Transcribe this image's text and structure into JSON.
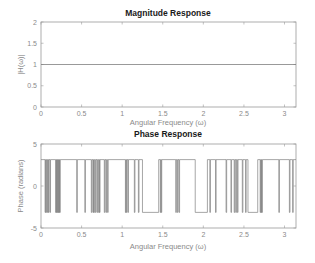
{
  "chart_data": [
    {
      "type": "line",
      "title": "Magnitude Response",
      "xlabel": "Angular Frequency (ω)",
      "ylabel": "|H(ω)|",
      "xlim": [
        0,
        3.1416
      ],
      "ylim": [
        0,
        2
      ],
      "xticks": [
        "0",
        "0.5",
        "1",
        "1.5",
        "2",
        "2.5",
        "3"
      ],
      "yticks": [
        "0",
        "0.5",
        "1",
        "1.5",
        "2"
      ],
      "grid": false,
      "series": [
        {
          "name": "|H(ω)|",
          "x": [
            0,
            3.1416
          ],
          "y": [
            1,
            1
          ],
          "color": "#7f7f7f"
        }
      ]
    },
    {
      "type": "line",
      "title": "Phase Response",
      "xlabel": "Angular Frequency (ω)",
      "ylabel": "Phase (radians)",
      "xlim": [
        0,
        3.1416
      ],
      "ylim": [
        -5,
        5
      ],
      "xticks": [
        "0",
        "0.5",
        "1",
        "1.5",
        "2",
        "2.5",
        "3"
      ],
      "yticks": [
        "-5",
        "0",
        "5"
      ],
      "grid": false,
      "levels": {
        "high": 3.1416,
        "low": -3.1416
      },
      "series": [
        {
          "name": "phase",
          "color": "#7f7f7f",
          "spikes": [
            0.05,
            0.06,
            0.08,
            0.09,
            0.11,
            0.18,
            0.19,
            0.2,
            0.21,
            0.22,
            0.23,
            0.44,
            0.54,
            0.62,
            0.64,
            0.65,
            0.67,
            0.69,
            0.71,
            0.72,
            0.78,
            0.8,
            0.82,
            1.04,
            1.05,
            1.07,
            1.15,
            1.2,
            1.47,
            1.48,
            1.66,
            1.68,
            1.7,
            2.08,
            2.15,
            2.28,
            2.34,
            2.38,
            2.4,
            2.42,
            2.48,
            2.52,
            2.7,
            2.71,
            2.72,
            2.93,
            3.06,
            3.1
          ],
          "low_plateaus": [
            [
              1.25,
              1.45
            ],
            [
              1.9,
              2.05
            ],
            [
              2.55,
              2.67
            ]
          ]
        }
      ]
    }
  ]
}
